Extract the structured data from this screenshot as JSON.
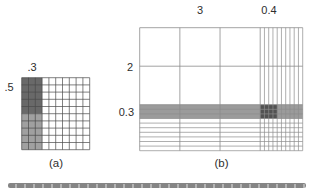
{
  "figure_a": {
    "caption": "(a)",
    "top_label": ".3",
    "left_label": ".5",
    "grid": {
      "cols": 10,
      "rows": 10,
      "shaded_cols": 3,
      "dark_rows": 5,
      "dark_color": "#696969",
      "light_color": "#a0a0a0",
      "line_color": "#4a4a4a"
    },
    "represents": "0.5 x 0.3 = 0.15"
  },
  "figure_b": {
    "caption": "(b)",
    "top_label_whole": "3",
    "top_label_fraction": "0.4",
    "left_label_whole": "2",
    "left_label_fraction": "0.3",
    "grid": {
      "big_cols": 3,
      "thin_cols": 10,
      "big_rows": 2,
      "thin_rows": 10,
      "shaded_thin_rows": 3,
      "dark_thin_cols": 4,
      "band_color": "#9b9b9b",
      "dark_color": "#525252",
      "line_color": "#8c8c8c"
    },
    "represents": "2.3 x 3.4 area model"
  },
  "separator": {
    "color_dark": "#858585",
    "color_light": "#b4b4b4"
  }
}
